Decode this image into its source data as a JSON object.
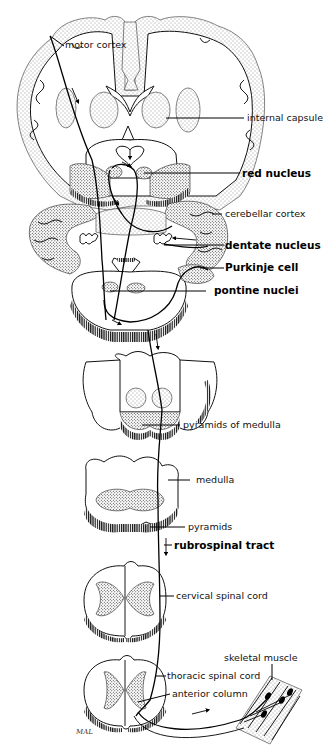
{
  "diagram": {
    "signature": "MAL",
    "labels": {
      "motor_cortex": "motor cortex",
      "internal_capsule": "internal capsule",
      "red_nucleus": "red nucleus",
      "cerebellar_cortex": "cerebellar cortex",
      "dentate_nucleus": "dentate nucleus",
      "purkinje_cell": "Purkinje cell",
      "pontine_nuclei": "pontine nuclei",
      "pyramids_of_medulla": "pyramids of medulla",
      "medulla": "medulla",
      "pyramids": "pyramids",
      "rubrospinal_tract": "rubrospinal tract",
      "cervical_spinal_cord": "cervical spinal cord",
      "skeletal_muscle": "skeletal muscle",
      "thoracic_spinal_cord": "thoracic spinal cord",
      "anterior_column": "anterior column"
    },
    "bold_labels": [
      "red nucleus",
      "dentate nucleus",
      "Purkinje cell",
      "pontine nuclei",
      "rubrospinal tract"
    ],
    "sections": [
      "cerebrum-coronal",
      "midbrain",
      "cerebellum-pons",
      "upper-medulla",
      "lower-medulla",
      "cervical-cord",
      "thoracic-cord",
      "skeletal-muscle"
    ],
    "colors": {
      "ink": "#000000",
      "background": "#ffffff"
    }
  }
}
